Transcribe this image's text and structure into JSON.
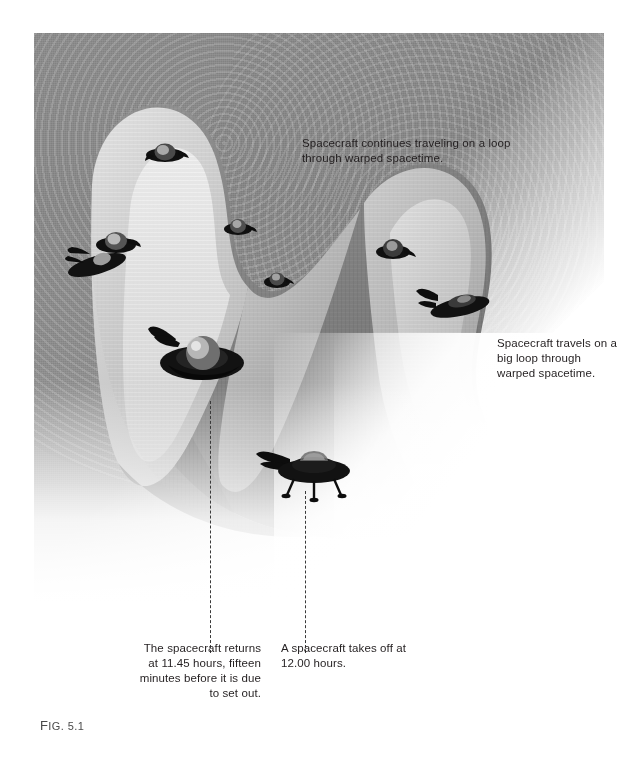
{
  "figure": {
    "number_label": "Fig. 5.1",
    "number_prefix": "F",
    "number_rest": "IG. 5.1"
  },
  "annotations": [
    {
      "id": "anno-top",
      "text": "Spacecraft continues traveling on a loop through warped spacetime."
    },
    {
      "id": "anno-right",
      "text": "Spacecraft travels on a big loop through warped spacetime."
    }
  ],
  "captions": [
    {
      "id": "caption-left",
      "text": "The spacecraft returns at 11.45 hours, fifteen minutes before it is due to set out."
    },
    {
      "id": "caption-right",
      "text": "A spacecraft takes off at 12.00 hours."
    }
  ],
  "icons": {
    "spacecraft": "spacecraft-icon",
    "dashed_guide": "dashed-guide-line"
  },
  "colors": {
    "ink": "#231f20",
    "field_grey": "#8d8d8d",
    "sheet_light": "#d9d9d9",
    "sheet_dark": "#7a7a7a",
    "craft_body": "#141414",
    "background": "#ffffff"
  },
  "spacecraft_positions": [
    {
      "name": "craft-upper-left",
      "x": 96,
      "y": 192
    },
    {
      "name": "craft-top-mid",
      "x": 148,
      "y": 100
    },
    {
      "name": "craft-left-mid",
      "x": 62,
      "y": 200
    },
    {
      "name": "craft-center",
      "x": 192,
      "y": 178
    },
    {
      "name": "craft-center-low",
      "x": 410,
      "y": 240
    },
    {
      "name": "craft-right-upper",
      "x": 348,
      "y": 190
    },
    {
      "name": "craft-right-saucer",
      "x": 386,
      "y": 248
    },
    {
      "name": "craft-big-left",
      "x": 128,
      "y": 300
    },
    {
      "name": "craft-landing",
      "x": 236,
      "y": 418
    }
  ]
}
